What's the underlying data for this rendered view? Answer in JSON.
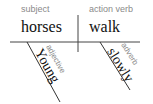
{
  "diagram": {
    "type": "sentence-diagram",
    "sentence": "Young horses walk slowly",
    "baseline": {
      "subject": {
        "label": "subject",
        "word": "horses"
      },
      "verb": {
        "label": "action verb",
        "word": "walk"
      }
    },
    "modifiers": [
      {
        "label": "adjective",
        "word": "Young",
        "modifies": "horses"
      },
      {
        "label": "adverb",
        "word": "slowly",
        "modifies": "walk"
      }
    ],
    "colors": {
      "line": "#333333",
      "role_text": "#8a8a8a",
      "word_text": "#111111"
    }
  }
}
